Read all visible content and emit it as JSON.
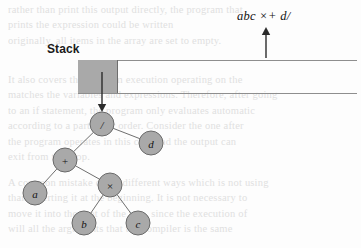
{
  "figure": {
    "stack_label": "Stack",
    "expression": "abc ×+ d/"
  },
  "stack_bar": {
    "filled_portion_label": "",
    "top_rule_y": 60,
    "bottom_rule_y": 93
  },
  "arrows": [
    {
      "name": "expression-pointer-arrow",
      "direction": "up",
      "x": 266,
      "from_y": 58,
      "to_y": 27
    },
    {
      "name": "stack-to-tree-arrow",
      "direction": "down",
      "x": 102,
      "from_y": 72,
      "to_y": 112
    }
  ],
  "tree": {
    "type": "expression-tree",
    "nodes": [
      {
        "id": "root",
        "label": "/",
        "cx": 102,
        "cy": 124,
        "r": 12
      },
      {
        "id": "plus",
        "label": "+",
        "cx": 65,
        "cy": 160,
        "r": 12
      },
      {
        "id": "d",
        "label": "d",
        "cx": 151,
        "cy": 143,
        "r": 12
      },
      {
        "id": "a",
        "label": "a",
        "cx": 35,
        "cy": 193,
        "r": 12
      },
      {
        "id": "times",
        "label": "×",
        "cx": 110,
        "cy": 185,
        "r": 12
      },
      {
        "id": "b",
        "label": "b",
        "cx": 84,
        "cy": 223,
        "r": 12
      },
      {
        "id": "c",
        "label": "c",
        "cx": 138,
        "cy": 223,
        "r": 12
      }
    ],
    "edges": [
      {
        "from": "root",
        "to": "plus"
      },
      {
        "from": "root",
        "to": "d"
      },
      {
        "from": "plus",
        "to": "a"
      },
      {
        "from": "plus",
        "to": "times"
      },
      {
        "from": "times",
        "to": "b"
      },
      {
        "from": "times",
        "to": "c"
      }
    ]
  },
  "background_text": {
    "note": "faint bleed-through body text visible behind the figure",
    "lines": [
      {
        "text": "rather than print this output directly, the program that",
        "x": 8,
        "y": 2
      },
      {
        "text": "prints the expression could be written",
        "x": 8,
        "y": 17
      },
      {
        "text": "originally, all items in the array are set to empty.",
        "x": 8,
        "y": 33
      },
      {
        "text": "It also covers the program execution operating on the",
        "x": 8,
        "y": 72
      },
      {
        "text": "matches the variables and expressions. Therefore, after going",
        "x": 8,
        "y": 87
      },
      {
        "text": "to an if statement, the program only evaluates automatic",
        "x": 8,
        "y": 103
      },
      {
        "text": "according to a particular order. Consider the one after",
        "x": 8,
        "y": 118
      },
      {
        "text": "the program operates in this case and the output can",
        "x": 8,
        "y": 134
      },
      {
        "text": "exit from the loop.",
        "x": 8,
        "y": 149
      },
      {
        "text": "A common mistake done, different ways which is not using",
        "x": 8,
        "y": 175
      },
      {
        "text": "than inserting it at the beginning. It is not necessary to",
        "x": 8,
        "y": 190
      },
      {
        "text": "move it into the root of the tree, since the execution of",
        "x": 8,
        "y": 206
      },
      {
        "text": "will all the arguments that the compiler is the same",
        "x": 8,
        "y": 221
      }
    ]
  },
  "colors": {
    "node_fill": "#a9a9a9",
    "node_stroke": "#6a6a6a",
    "edge_stroke": "#6f6f6f",
    "stack_fill": "#a9a9a9",
    "rule_stroke": "#8e8e8e",
    "arrow": "#2b2b2b",
    "text": "#141414",
    "ghost_text": "#cfcfcf",
    "page_background": "#fdfdfd"
  }
}
